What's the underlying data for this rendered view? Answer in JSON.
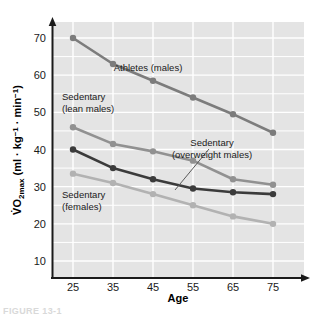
{
  "figure": {
    "caption_partial": "FIGURE 13-1"
  },
  "chart_data": {
    "type": "line",
    "title": "",
    "xlabel": "Age",
    "ylabel": "V̇O₂max  (ml · kg⁻¹ · min⁻¹)",
    "x": [
      25,
      35,
      45,
      55,
      65,
      75
    ],
    "xtick_labels": [
      "25",
      "35",
      "45",
      "55",
      "65",
      "75"
    ],
    "ytick_labels": [
      "10",
      "20",
      "30",
      "40",
      "50",
      "60",
      "70"
    ],
    "yticks": [
      10,
      20,
      30,
      40,
      50,
      60,
      70
    ],
    "xlim": [
      20,
      80
    ],
    "ylim": [
      5,
      73
    ],
    "grid": true,
    "grid_color": "#ffffff",
    "plot_background": "#e4e4e4",
    "legend_position": "inline-annotations",
    "series": [
      {
        "name": "Athletes (males)",
        "label_text_lines": [
          "Athletes (males)"
        ],
        "color": "#7c7c7c",
        "values": [
          70,
          63,
          58.5,
          54,
          49.5,
          44.5
        ]
      },
      {
        "name": "Sedentary (lean males)",
        "label_text_lines": [
          "Sedentary",
          "(lean males)"
        ],
        "color": "#919191",
        "values": [
          46,
          41.5,
          39.5,
          37,
          32,
          30.5
        ]
      },
      {
        "name": "Sedentary (overweight males)",
        "label_text_lines": [
          "Sedentary",
          "(overweight males)"
        ],
        "color": "#3b3b3b",
        "values": [
          40,
          35,
          32,
          29.5,
          28.5,
          28
        ]
      },
      {
        "name": "Sedentary (females)",
        "label_text_lines": [
          "Sedentary",
          "(females)"
        ],
        "color": "#b2b2b2",
        "values": [
          33.5,
          31,
          28,
          25,
          22,
          20
        ]
      }
    ],
    "annotations": [
      {
        "name": "athletes-males",
        "lines": [
          "Athletes (males)"
        ],
        "x": 148,
        "y": 71
      },
      {
        "name": "sedentary-lean-males",
        "lines": [
          "Sedentary",
          "(lean males)"
        ],
        "x": 62,
        "y": 100
      },
      {
        "name": "sedentary-overweight-males",
        "lines": [
          "Sedentary",
          "(overweight males)"
        ],
        "x": 212,
        "y": 146
      },
      {
        "name": "sedentary-females",
        "lines": [
          "Sedentary",
          "(females)"
        ],
        "x": 62,
        "y": 198
      }
    ],
    "axis_color": "#1a1a1a"
  }
}
